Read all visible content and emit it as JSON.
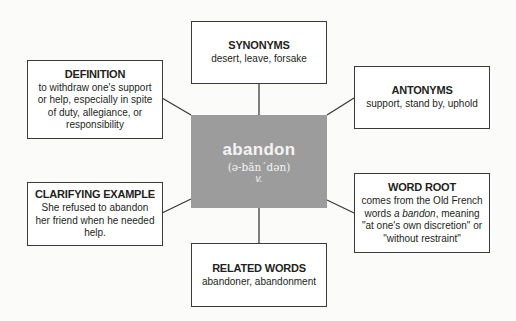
{
  "center": {
    "word": "abandon",
    "pronunciation": "(ə-băn´dən)",
    "part_of_speech": "v.",
    "color": "#9c9c9c"
  },
  "boxes": {
    "synonyms": {
      "title": "SYNONYMS",
      "body": "desert, leave, forsake"
    },
    "antonyms": {
      "title": "ANTONYMS",
      "body": "support, stand by, uphold"
    },
    "definition": {
      "title": "DEFINITION",
      "body": "to withdraw one's support or help, especially in spite of duty, allegiance, or responsibility"
    },
    "clarifying_example": {
      "title": "CLARIFYING EXAMPLE",
      "body": "She refused to abandon her friend when he needed help."
    },
    "word_root": {
      "title": "WORD ROOT",
      "body_pre": "comes from the Old French words ",
      "body_italic": "a bandon",
      "body_post": ", meaning \"at one's own discretion\" or \"without restraint\""
    },
    "related_words": {
      "title": "RELATED WORDS",
      "body": "abandoner, abandonment"
    }
  }
}
